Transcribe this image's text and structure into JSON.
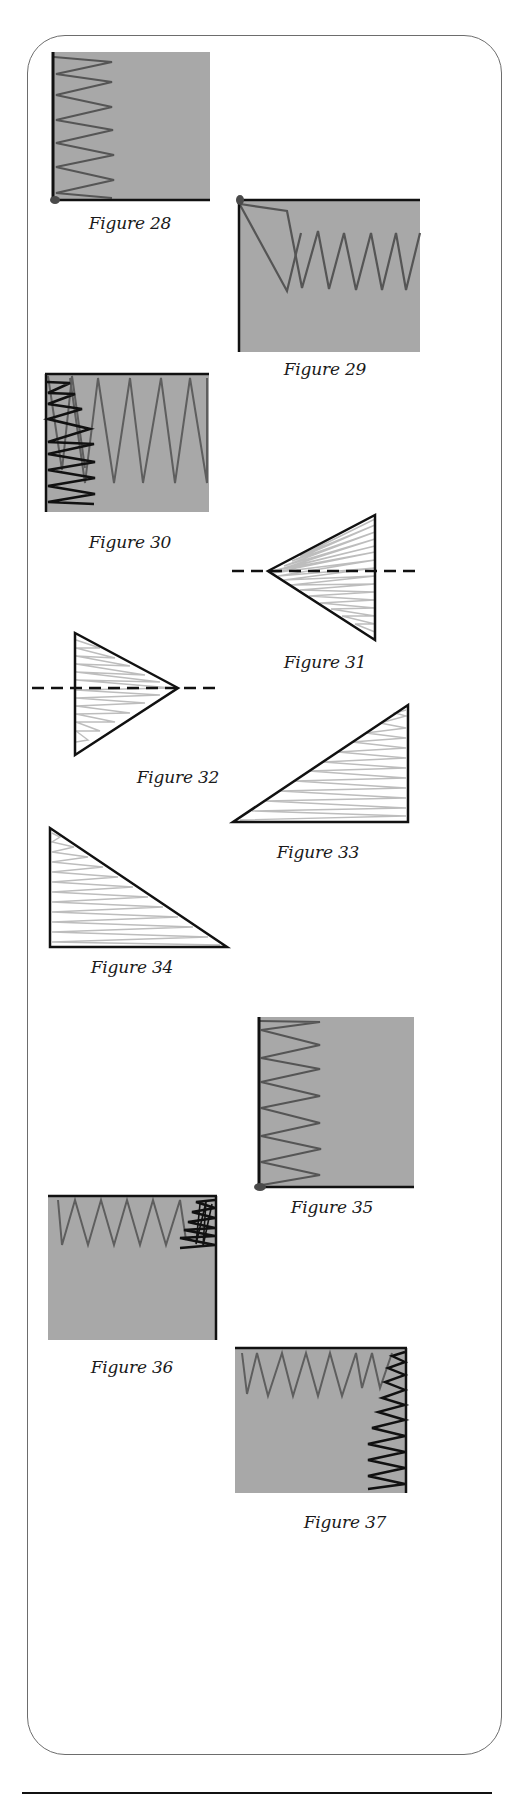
{
  "page": {
    "colors": {
      "fabric": "#a8a8a8",
      "stitch_gray": "#5e5e5e",
      "stitch_black": "#111111",
      "hatch": "#bdbdbd",
      "edge": "#111111",
      "dot": "#4a4a4a",
      "frame": "#6d6d6d"
    }
  },
  "figures": [
    {
      "id": 28,
      "caption": "Figure 28",
      "type": "square-zigzag-left-edge",
      "edges": [
        "left",
        "bottom"
      ],
      "dot": "bottom-left"
    },
    {
      "id": 29,
      "caption": "Figure 29",
      "type": "square-zigzag-top-edge",
      "edges": [
        "top",
        "left"
      ],
      "dot": "top-left"
    },
    {
      "id": 30,
      "caption": "Figure 30",
      "type": "square-zigzag-corner",
      "edges": [
        "top",
        "left"
      ]
    },
    {
      "id": 31,
      "caption": "Figure 31",
      "type": "triangle-hatched-center-line",
      "apex": "left"
    },
    {
      "id": 32,
      "caption": "Figure 32",
      "type": "triangle-hatched-center-line",
      "apex": "right"
    },
    {
      "id": 33,
      "caption": "Figure 33",
      "type": "right-triangle-hatched",
      "right_angle": "bottom-right"
    },
    {
      "id": 34,
      "caption": "Figure 34",
      "type": "right-triangle-hatched",
      "right_angle": "bottom-left"
    },
    {
      "id": 35,
      "caption": "Figure 35",
      "type": "square-zigzag-left-edge",
      "edges": [
        "left",
        "bottom"
      ],
      "dot": "bottom-left"
    },
    {
      "id": 36,
      "caption": "Figure 36",
      "type": "square-zigzag-corner",
      "edges": [
        "top",
        "right"
      ]
    },
    {
      "id": 37,
      "caption": "Figure 37",
      "type": "square-zigzag-corner",
      "edges": [
        "top",
        "right"
      ]
    }
  ]
}
